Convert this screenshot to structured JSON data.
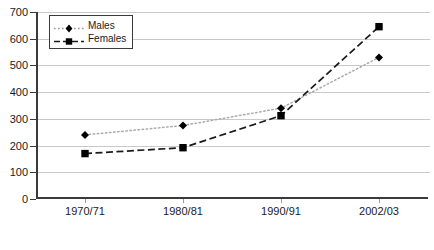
{
  "chart_data": {
    "type": "line",
    "title": "",
    "subtitle": "",
    "xlabel": "",
    "ylabel": "",
    "categories": [
      "1970/71",
      "1980/81",
      "1990/91",
      "2002/03"
    ],
    "series": [
      {
        "name": "Males",
        "values": [
          240,
          275,
          340,
          530
        ],
        "marker": "diamond",
        "line_style": "dotted",
        "color": "#000000",
        "line_color": "#aaaaaa"
      },
      {
        "name": "Females",
        "values": [
          170,
          192,
          312,
          645
        ],
        "marker": "square",
        "line_style": "dashed",
        "color": "#000000",
        "line_color": "#1a1a1a"
      }
    ],
    "ylim": [
      0,
      700
    ],
    "y_ticks": [
      0,
      100,
      200,
      300,
      400,
      500,
      600,
      700
    ],
    "y_tick_labels": [
      "0",
      "100",
      "200",
      "300",
      "400",
      "500",
      "600",
      "700"
    ],
    "grid": "horizontal",
    "legend_position": "top-left-inside"
  },
  "legend": {
    "entries": [
      {
        "label": "Males"
      },
      {
        "label": "Females"
      }
    ]
  },
  "colors": {
    "axis": "#3a3a3a",
    "grid": "#c9c9c9",
    "males_line": "#aaaaaa",
    "females_line": "#1a1a1a",
    "marker": "#000000",
    "text": "#1a1a1a",
    "background": "#ffffff"
  }
}
